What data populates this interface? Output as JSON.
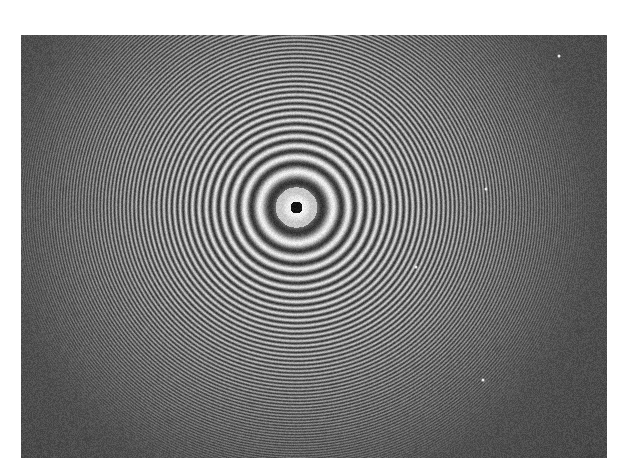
{
  "image": {
    "subject": "Concentric interference fringes (Newton's rings pattern)",
    "caption": "",
    "frame": {
      "x": 21,
      "y": 35,
      "width": 586,
      "height": 423
    },
    "center": {
      "x": 275,
      "y": 172
    },
    "central_spot_radius": 6,
    "first_ring_radius": 26,
    "ring_visibility_radius": 300,
    "colors": {
      "background": "#ffffff",
      "dark_field": "#484848",
      "bright_fringe": "#e6e6e6",
      "dark_fringe": "#3a3a3a",
      "central_spot": "#111111"
    },
    "specks": [
      {
        "x": 538,
        "y": 21
      },
      {
        "x": 395,
        "y": 232
      },
      {
        "x": 465,
        "y": 154
      },
      {
        "x": 462,
        "y": 345
      }
    ]
  }
}
